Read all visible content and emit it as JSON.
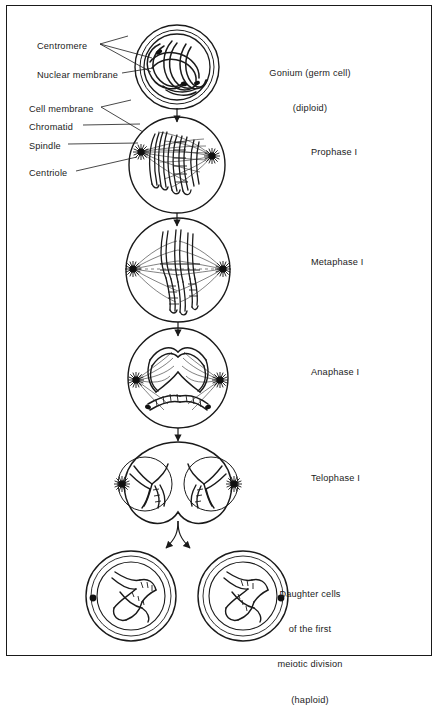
{
  "figure": {
    "background_color": "#ffffff",
    "ink_color": "#1a1a1a",
    "border": "thin rectangular frame"
  },
  "part_labels": [
    {
      "id": "centromere",
      "text": "Centromere",
      "x": 37,
      "y": 47,
      "leader": "two-branch"
    },
    {
      "id": "nuclear-membrane",
      "text": "Nuclear membrane",
      "x": 37,
      "y": 76,
      "leader": "single"
    },
    {
      "id": "cell-membrane",
      "text": "Cell membrane",
      "x": 29,
      "y": 110,
      "leader": "two-branch"
    },
    {
      "id": "chromatid",
      "text": "Chromatid",
      "x": 29,
      "y": 128,
      "leader": "single"
    },
    {
      "id": "spindle",
      "text": "Spindle",
      "x": 29,
      "y": 147,
      "leader": "single"
    },
    {
      "id": "centriole",
      "text": "Centriole",
      "x": 29,
      "y": 174,
      "leader": "single"
    }
  ],
  "stages": [
    {
      "id": "gonium",
      "lines": [
        "Gonium (germ cell)",
        "(diploid)"
      ],
      "align": "center",
      "label_x": 310,
      "label_y": 46,
      "cell_cx": 177,
      "cell_cy": 67,
      "cell_r": 42
    },
    {
      "id": "prophase-1",
      "lines": [
        "Prophase I"
      ],
      "align": "left",
      "label_x": 311,
      "label_y": 151,
      "cell_cx": 177,
      "cell_cy": 165,
      "cell_r": 48
    },
    {
      "id": "metaphase-1",
      "lines": [
        "Metaphase I"
      ],
      "align": "left",
      "label_x": 311,
      "label_y": 261,
      "cell_cx": 178,
      "cell_cy": 270,
      "cell_r": 52
    },
    {
      "id": "anaphase-1",
      "lines": [
        "Anaphase I"
      ],
      "align": "left",
      "label_x": 311,
      "label_y": 371,
      "cell_cx": 178,
      "cell_cy": 378,
      "cell_r": 50
    },
    {
      "id": "telophase-1",
      "lines": [
        "Telophase I"
      ],
      "align": "left",
      "label_x": 311,
      "label_y": 477,
      "cell_cx": 178,
      "cell_cy": 484,
      "cell_r": 50
    },
    {
      "id": "daughter-cells",
      "lines": [
        "Daughter cells",
        "of the first",
        "meiotic division",
        "(haploid)"
      ],
      "align": "center",
      "label_x": 310,
      "label_y": 569,
      "cell_cx": 178,
      "cell_cy": 595,
      "cell_r": 45
    }
  ],
  "connectors": [
    {
      "id": "gonium-to-prophase",
      "type": "straight-arrow",
      "from_y": 108,
      "to_y": 124
    },
    {
      "id": "prophase-to-metaphase",
      "type": "straight-arrow",
      "from_y": 213,
      "to_y": 227
    },
    {
      "id": "metaphase-to-anaphase",
      "type": "straight-arrow",
      "from_y": 322,
      "to_y": 337
    },
    {
      "id": "anaphase-to-telophase",
      "type": "straight-arrow",
      "from_y": 428,
      "to_y": 442
    },
    {
      "id": "telophase-to-daughters",
      "type": "forked-arrow",
      "from_y": 521,
      "to_y": 556
    }
  ]
}
